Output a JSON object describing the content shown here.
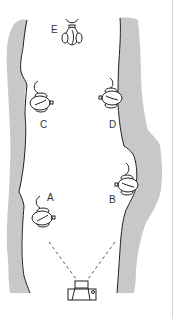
{
  "diagram": {
    "colors": {
      "bank_fill": "#c8c8c8",
      "line": "#222222",
      "background": "#ffffff"
    },
    "subjects": [
      {
        "id": "E",
        "label": "E",
        "x": 72,
        "y": 38
      },
      {
        "id": "C",
        "label": "C",
        "x": 40,
        "y": 103
      },
      {
        "id": "D",
        "label": "D",
        "x": 112,
        "y": 98
      },
      {
        "id": "B",
        "label": "B",
        "x": 128,
        "y": 185
      },
      {
        "id": "A",
        "label": "A",
        "x": 42,
        "y": 218
      }
    ],
    "labels": {
      "E": "E",
      "C": "C",
      "D": "D",
      "B": "B",
      "A": "A"
    },
    "camera": {
      "label": "camera-icon",
      "x": 82,
      "y": 290
    }
  }
}
